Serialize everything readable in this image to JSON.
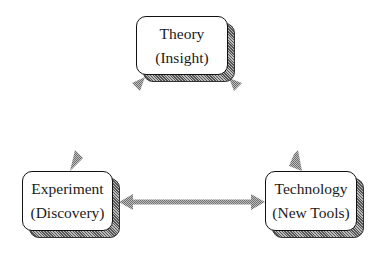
{
  "diagram": {
    "nodes": [
      {
        "id": "theory",
        "line1": "Theory",
        "line2": "(Insight)"
      },
      {
        "id": "experiment",
        "line1": "Experiment",
        "line2": "(Discovery)"
      },
      {
        "id": "technology",
        "line1": "Technology",
        "line2": "(New Tools)"
      }
    ],
    "edges": [
      {
        "from": "experiment",
        "to": "theory",
        "type": "bidirectional"
      },
      {
        "from": "theory",
        "to": "technology",
        "type": "bidirectional"
      },
      {
        "from": "experiment",
        "to": "technology",
        "type": "bidirectional"
      }
    ],
    "colors": {
      "box_border": "#111111",
      "box_fill": "#ffffff",
      "shadow": "#777777",
      "arrow": "#9a9a9a"
    }
  }
}
